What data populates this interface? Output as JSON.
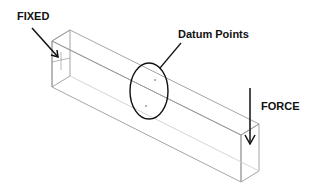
{
  "diagram": {
    "type": "beam-load-diagram",
    "labels": {
      "fixed": "FIXED",
      "datum_points": "Datum Points",
      "force": "FORCE"
    },
    "colors": {
      "outline": "#8a8a8a",
      "annotation": "#111111",
      "background": "#ffffff"
    }
  }
}
